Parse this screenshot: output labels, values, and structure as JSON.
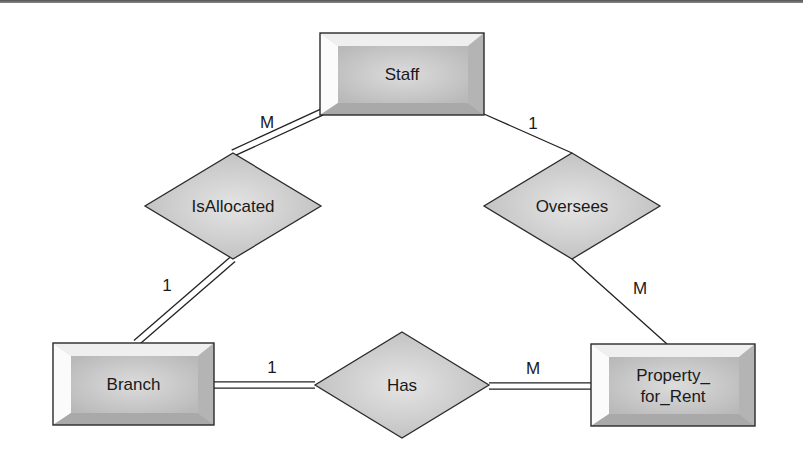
{
  "diagram": {
    "type": "er-diagram",
    "entities": [
      {
        "id": "staff",
        "label": "Staff",
        "lines": [
          "Staff"
        ],
        "x": 320,
        "y": 33,
        "w": 164,
        "h": 82
      },
      {
        "id": "branch",
        "label": "Branch",
        "lines": [
          "Branch"
        ],
        "x": 53,
        "y": 343,
        "w": 161,
        "h": 82
      },
      {
        "id": "property_for_rent",
        "label": "Property_for_Rent",
        "lines": [
          "Property_",
          "for_Rent"
        ],
        "x": 591,
        "y": 344,
        "w": 164,
        "h": 82
      }
    ],
    "relationships": [
      {
        "id": "isallocated",
        "label": "IsAllocated",
        "cx": 233,
        "cy": 206,
        "hw": 88,
        "hh": 53
      },
      {
        "id": "oversees",
        "label": "Oversees",
        "cx": 572,
        "cy": 206,
        "hw": 88,
        "hh": 53
      },
      {
        "id": "has",
        "label": "Has",
        "cx": 402,
        "cy": 385,
        "hw": 87,
        "hh": 53
      }
    ],
    "connections": [
      {
        "from": "staff",
        "to": "isallocated",
        "cardinality": "M",
        "participation": "total",
        "x1": 322,
        "y1": 112,
        "x2": 233,
        "y2": 153,
        "label_x": 267,
        "label_y": 128
      },
      {
        "from": "isallocated",
        "to": "branch",
        "cardinality": "1",
        "participation": "total",
        "x1": 233,
        "y1": 259,
        "x2": 136,
        "y2": 343,
        "label_x": 167,
        "label_y": 291
      },
      {
        "from": "staff",
        "to": "oversees",
        "cardinality": "1",
        "participation": "partial",
        "x1": 484,
        "y1": 114,
        "x2": 572,
        "y2": 153,
        "label_x": 533,
        "label_y": 129
      },
      {
        "from": "oversees",
        "to": "property_for_rent",
        "cardinality": "M",
        "participation": "partial",
        "x1": 572,
        "y1": 259,
        "x2": 667,
        "y2": 344,
        "label_x": 640,
        "label_y": 294
      },
      {
        "from": "branch",
        "to": "has",
        "cardinality": "1",
        "participation": "total",
        "x1": 214,
        "y1": 385,
        "x2": 315,
        "y2": 385,
        "label_x": 272,
        "label_y": 373
      },
      {
        "from": "has",
        "to": "property_for_rent",
        "cardinality": "M",
        "participation": "total",
        "x1": 489,
        "y1": 386,
        "x2": 591,
        "y2": 386,
        "label_x": 533,
        "label_y": 374
      }
    ]
  }
}
